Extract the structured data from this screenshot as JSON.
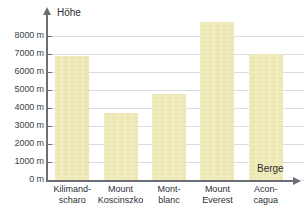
{
  "chart_data": {
    "type": "bar",
    "title": "",
    "xlabel": "Berge",
    "ylabel": "Höhe",
    "categories": [
      "Kilimandscharo",
      "Mount Koscinszko",
      "Mont-blanc",
      "Mount Everest",
      "Aconcagua"
    ],
    "category_lines": [
      [
        "Kilimand-",
        "scharo"
      ],
      [
        "Mount",
        "Koscinszko"
      ],
      [
        "Mont-",
        "blanc"
      ],
      [
        "Mount",
        "Everest"
      ],
      [
        "Acon-",
        "cagua"
      ]
    ],
    "values": [
      6900,
      3700,
      4800,
      8800,
      7000
    ],
    "unit": "m",
    "ylim": [
      0,
      8000
    ],
    "ytick_step": 1000,
    "ytick_labels": [
      "0 m",
      "1000 m",
      "2000 m",
      "3000 m",
      "4000 m",
      "5000 m",
      "6000 m",
      "7000 m",
      "8000 m"
    ],
    "ytick_values": [
      0,
      1000,
      2000,
      3000,
      4000,
      5000,
      6000,
      7000,
      8000
    ],
    "grid": true,
    "legend": "none",
    "bar_color": "#ece6ae",
    "grid_color": "#d9dde2",
    "axis_color": "#6b6f75",
    "text_color": "#2b2f34"
  }
}
